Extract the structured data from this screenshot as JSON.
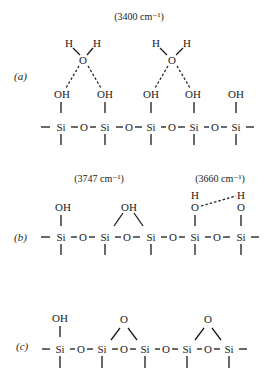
{
  "diagram": {
    "panel_a": {
      "label": "(a)",
      "annotation": "(3400 cm⁻¹)",
      "h": "H",
      "o": "O",
      "oh": "OH",
      "si": "Si"
    },
    "panel_b": {
      "label": "(b)",
      "annotation_left": "(3747 cm⁻¹)",
      "annotation_right": "(3660 cm⁻¹)",
      "h": "H",
      "o": "O",
      "oh": "OH",
      "si": "Si"
    },
    "panel_c": {
      "label": "(c)",
      "o": "O",
      "oh": "OH",
      "si": "Si"
    }
  }
}
